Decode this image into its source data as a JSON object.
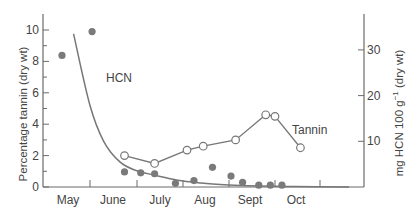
{
  "chart_data": {
    "type": "line",
    "title": "",
    "xlabel": "",
    "x_categories": [
      "May",
      "June",
      "July",
      "Aug",
      "Sept",
      "Oct"
    ],
    "left_axis": {
      "label": "Percentage tannin (dry wt)",
      "ticks": [
        0,
        2,
        4,
        6,
        8,
        10
      ],
      "minor_ticks": [
        1,
        3,
        5,
        7,
        9
      ],
      "range": [
        0,
        11
      ]
    },
    "right_axis": {
      "label": "mg HCN 100 g⁻¹ (dry wt)",
      "label_main": "mg HCN 100 g",
      "label_sup": "−1",
      "label_tail": " (dry wt)",
      "ticks": [
        10,
        20,
        30
      ],
      "range": [
        0,
        35
      ]
    },
    "series": [
      {
        "name": "Tannin",
        "axis": "left",
        "style": "open-circles-with-line",
        "points": [
          {
            "month_pos": 1.35,
            "value": 2.0
          },
          {
            "month_pos": 2.0,
            "value": 1.5
          },
          {
            "month_pos": 2.7,
            "value": 2.35
          },
          {
            "month_pos": 3.05,
            "value": 2.6
          },
          {
            "month_pos": 3.75,
            "value": 3.0
          },
          {
            "month_pos": 4.4,
            "value": 4.6
          },
          {
            "month_pos": 4.6,
            "value": 4.5
          },
          {
            "month_pos": 5.15,
            "value": 2.5
          }
        ]
      },
      {
        "name": "HCN",
        "axis": "right",
        "style": "filled-circles",
        "points": [
          {
            "month_pos": 0.0,
            "value": 28.8
          },
          {
            "month_pos": 0.65,
            "value": 34.0
          },
          {
            "month_pos": 1.35,
            "value": 3.3
          },
          {
            "month_pos": 1.7,
            "value": 3.1
          },
          {
            "month_pos": 2.0,
            "value": 2.9
          },
          {
            "month_pos": 2.45,
            "value": 0.8
          },
          {
            "month_pos": 2.85,
            "value": 1.4
          },
          {
            "month_pos": 3.25,
            "value": 4.3
          },
          {
            "month_pos": 3.65,
            "value": 2.4
          },
          {
            "month_pos": 3.9,
            "value": 1.0
          },
          {
            "month_pos": 4.25,
            "value": 0.4
          },
          {
            "month_pos": 4.5,
            "value": 0.4
          },
          {
            "month_pos": 4.75,
            "value": 0.4
          }
        ]
      },
      {
        "name": "HCN fitted curve",
        "axis": "right",
        "style": "smooth-curve",
        "points": [
          {
            "month_pos": 0.25,
            "value": 33.5
          },
          {
            "month_pos": 0.6,
            "value": 18.0
          },
          {
            "month_pos": 0.9,
            "value": 10.0
          },
          {
            "month_pos": 1.25,
            "value": 5.5
          },
          {
            "month_pos": 1.6,
            "value": 3.6
          },
          {
            "month_pos": 2.0,
            "value": 2.6
          },
          {
            "month_pos": 2.5,
            "value": 1.5
          },
          {
            "month_pos": 3.0,
            "value": 0.9
          },
          {
            "month_pos": 3.5,
            "value": 0.5
          },
          {
            "month_pos": 4.0,
            "value": 0.3
          },
          {
            "month_pos": 5.0,
            "value": 0.1
          },
          {
            "month_pos": 6.2,
            "value": 0.0
          }
        ]
      }
    ],
    "annotations": [
      {
        "text": "HCN",
        "near": "fitted curve, upper left"
      },
      {
        "text": "Tannin",
        "near": "tannin series, right"
      }
    ],
    "grid": false,
    "legend": "inline labels"
  },
  "labels": {
    "hcn": "HCN",
    "tannin": "Tannin",
    "left_axis_title": "Percentage tannin (dry wt)",
    "right_axis_title_main": "mg HCN 100 g",
    "right_axis_title_sup": "−1",
    "right_axis_title_tail": " (dry wt)"
  }
}
